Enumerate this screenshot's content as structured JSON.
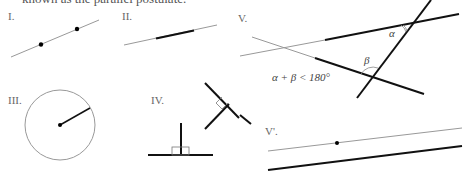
{
  "caption_fragment": "known as the parallel postulate.",
  "figures": {
    "I": {
      "label": "I."
    },
    "II": {
      "label": "II."
    },
    "III": {
      "label": "III."
    },
    "IV": {
      "label": "IV."
    },
    "V": {
      "label": "V.",
      "alpha": "α",
      "beta": "β",
      "inequality": "α + β < 180°"
    },
    "V_prime": {
      "label": "V'."
    }
  },
  "colors": {
    "thin_line": "#999999",
    "thick_line": "#111111",
    "label": "#666666"
  }
}
